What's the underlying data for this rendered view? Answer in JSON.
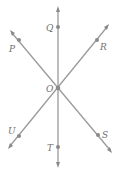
{
  "diagram": {
    "type": "intersecting-lines",
    "center": {
      "label": "O",
      "x": 58,
      "y": 88
    },
    "points": [
      {
        "label": "Q",
        "x": 58,
        "y": 27
      },
      {
        "label": "P",
        "x": 19,
        "y": 40
      },
      {
        "label": "R",
        "x": 97,
        "y": 40
      },
      {
        "label": "O",
        "x": 58,
        "y": 88
      },
      {
        "label": "U",
        "x": 19,
        "y": 136
      },
      {
        "label": "S",
        "x": 98,
        "y": 135
      },
      {
        "label": "T",
        "x": 58,
        "y": 147
      }
    ],
    "lines": [
      {
        "name": "QT",
        "through": [
          "Q",
          "O",
          "T"
        ]
      },
      {
        "name": "PS",
        "through": [
          "P",
          "O",
          "S"
        ]
      },
      {
        "name": "RU",
        "through": [
          "R",
          "O",
          "U"
        ]
      }
    ],
    "labels": {
      "Q": "Q",
      "P": "P",
      "R": "R",
      "O": "O",
      "U": "U",
      "S": "S",
      "T": "T"
    },
    "colors": {
      "line": "#9a9a9a",
      "point": "#8a8a8a",
      "label": "#6f6f6f"
    }
  }
}
